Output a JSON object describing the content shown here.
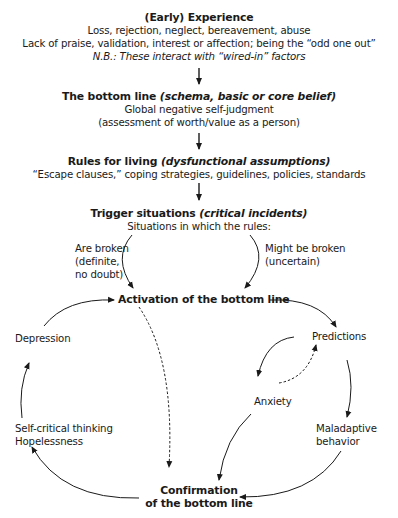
{
  "diagram": {
    "experience": {
      "title": "(Early) Experience",
      "line1": "Loss, rejection, neglect, bereavement, abuse",
      "line2": "Lack of praise, validation, interest or affection; being the “odd one out”",
      "note": "N.B.: These interact with “wired-in” factors"
    },
    "bottom_line": {
      "title": "The bottom line ",
      "title_italic": "(schema, basic or core belief)",
      "line1": "Global negative self-judgment",
      "line2": "(assessment of worth/value as a person)"
    },
    "rules": {
      "title": "Rules for living ",
      "title_italic": "(dysfunctional assumptions)",
      "line1": "“Escape clauses,” coping strategies, guidelines, policies, standards"
    },
    "trigger": {
      "title": "Trigger situations ",
      "title_italic": "(critical incidents)",
      "line1": "Situations in which the rules:",
      "left_branch": [
        "Are broken",
        "(definite,",
        "no doubt)"
      ],
      "right_branch": [
        "Might be broken",
        "(uncertain)"
      ]
    },
    "activation": "Activation of the bottom line",
    "cycle": {
      "predictions": "Predictions",
      "anxiety": "Anxiety",
      "maladaptive": [
        "Maladaptive",
        "behavior"
      ],
      "self_critical": [
        "Self-critical thinking",
        "Hopelessness"
      ],
      "depression": "Depression"
    },
    "confirmation": [
      "Confirmation",
      "of the bottom line"
    ]
  }
}
